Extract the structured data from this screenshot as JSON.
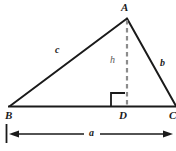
{
  "figure": {
    "background_color": "#ffffff",
    "stroke_color": "#1a1a1a",
    "dashed_color": "#8c8c8c",
    "width": 176,
    "height": 151,
    "vertices": [
      {
        "name": "A",
        "label": "A",
        "x": 127,
        "y": 18,
        "label_x": 121,
        "label_y": 2
      },
      {
        "name": "B",
        "label": "B",
        "x": 10,
        "y": 106,
        "label_x": 5,
        "label_y": 111
      },
      {
        "name": "C",
        "label": "C",
        "x": 176,
        "y": 106,
        "label_x": 169,
        "label_y": 111
      },
      {
        "name": "D",
        "label": "D",
        "x": 127,
        "y": 106,
        "label_x": 119,
        "label_y": 111
      }
    ],
    "sides": [
      {
        "name": "side-c-AB",
        "label": "c",
        "label_x": 55,
        "label_y": 48
      },
      {
        "name": "side-b-AC",
        "label": "b",
        "label_x": 160,
        "label_y": 60
      },
      {
        "name": "altitude-h-AD",
        "label": "h",
        "label_x": 110,
        "label_y": 56
      },
      {
        "name": "base-a-BC",
        "label": "a",
        "label_x": 89,
        "label_y": 129
      }
    ],
    "markers": {
      "right_angle_label": "right-angle-at-D",
      "dimension_label": "a"
    }
  }
}
